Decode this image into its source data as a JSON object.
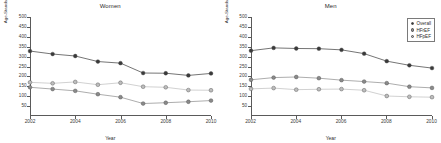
{
  "figure": {
    "panels": [
      "women",
      "men"
    ]
  },
  "chart_data": [
    {
      "type": "line",
      "title": "Women",
      "xlabel": "Year",
      "ylabel": "Age-Standardized Rate per 100 000",
      "x": [
        2002,
        2003,
        2004,
        2005,
        2006,
        2007,
        2008,
        2009,
        2010
      ],
      "xlim": [
        2002,
        2010
      ],
      "ylim": [
        0,
        500
      ],
      "yticks": [
        50,
        100,
        150,
        200,
        250,
        300,
        350,
        400,
        450,
        500
      ],
      "xticks": [
        2002,
        2004,
        2006,
        2008,
        2010
      ],
      "grid": false,
      "legend": "none",
      "series": [
        {
          "name": "Overall",
          "color": "#3a3a3a",
          "values": [
            328,
            313,
            303,
            275,
            267,
            217,
            216,
            205,
            215
          ]
        },
        {
          "name": "HFpEF",
          "color": "#bdbdbd",
          "values": [
            170,
            165,
            172,
            158,
            168,
            148,
            145,
            131,
            130
          ]
        },
        {
          "name": "HFrEF",
          "color": "#8a8a8a",
          "values": [
            145,
            136,
            127,
            110,
            95,
            63,
            67,
            72,
            78
          ]
        }
      ]
    },
    {
      "type": "line",
      "title": "Men",
      "xlabel": "Year",
      "ylabel": "Age-Standardized Rate per 100 000",
      "x": [
        2002,
        2003,
        2004,
        2005,
        2006,
        2007,
        2008,
        2009,
        2010
      ],
      "xlim": [
        2002,
        2010
      ],
      "ylim": [
        0,
        500
      ],
      "yticks": [
        50,
        100,
        150,
        200,
        250,
        300,
        350,
        400,
        450,
        500
      ],
      "xticks": [
        2002,
        2004,
        2006,
        2008,
        2010
      ],
      "grid": false,
      "legend": "top-right",
      "series": [
        {
          "name": "Overall",
          "color": "#3a3a3a",
          "values": [
            330,
            344,
            341,
            340,
            334,
            315,
            277,
            256,
            242
          ]
        },
        {
          "name": "HFrEF",
          "color": "#8a8a8a",
          "values": [
            183,
            194,
            197,
            191,
            181,
            174,
            166,
            148,
            142
          ]
        },
        {
          "name": "HFpEF",
          "color": "#bdbdbd",
          "values": [
            137,
            141,
            133,
            135,
            136,
            130,
            101,
            97,
            95
          ]
        }
      ]
    }
  ],
  "legend": {
    "items": [
      {
        "label": "Overall",
        "color": "#3a3a3a"
      },
      {
        "label": "HFrEF",
        "color": "#8a8a8a"
      },
      {
        "label": "HFpEF",
        "color": "#bdbdbd"
      }
    ]
  }
}
